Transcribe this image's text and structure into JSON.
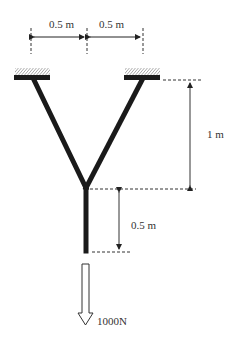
{
  "diagram": {
    "type": "structural-truss",
    "dimensions": {
      "top_left_span": "0.5 m",
      "top_right_span": "0.5 m",
      "upper_height": "1 m",
      "lower_height": "0.5 m"
    },
    "load": {
      "label": "1000N",
      "direction": "down"
    },
    "colors": {
      "member": "#1a1a1a",
      "line": "#333333",
      "background": "#ffffff"
    }
  }
}
